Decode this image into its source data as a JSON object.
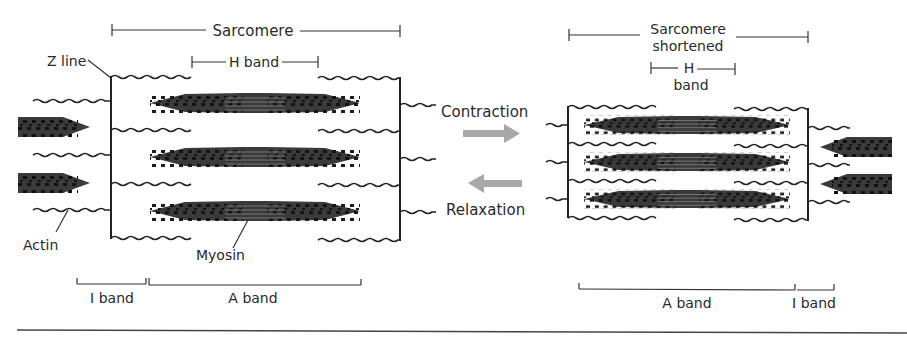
{
  "diagram": {
    "type": "sarcomere-contraction",
    "relaxed": {
      "sarcomere_label": "Sarcomere",
      "h_band_label": "H band",
      "z_line_label": "Z line",
      "actin_label": "Actin",
      "myosin_label": "Myosin",
      "i_band_label": "I band",
      "a_band_label": "A band"
    },
    "arrows": {
      "contraction_label": "Contraction",
      "relaxation_label": "Relaxation",
      "arrow_color": "#a8a8a8"
    },
    "contracted": {
      "sarcomere_label_line1": "Sarcomere",
      "sarcomere_label_line2": "shortened",
      "h_band_label_line1": "H",
      "h_band_label_line2": "band",
      "a_band_label": "A band",
      "i_band_label": "I band"
    },
    "colors": {
      "ink": "#222222",
      "arrow": "#a8a8a8",
      "background": "#ffffff"
    }
  }
}
